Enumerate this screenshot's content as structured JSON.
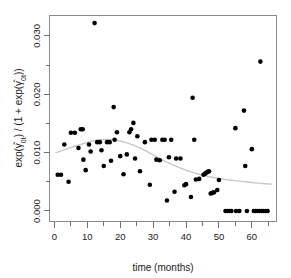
{
  "chart_data": {
    "type": "scatter",
    "title": "",
    "xlabel": "time (months)",
    "ylabel": "exp(γ̂0t) / (1 + exp(γ̂0t))",
    "ylabel_parts": {
      "prefix": "exp(",
      "gamma": "γ",
      "hat": "^",
      "sub1": "0t",
      "mid": ") / (1 + exp(",
      "sub2": "0t",
      "suffix": "))"
    },
    "xlim": [
      -1.5,
      67.5
    ],
    "ylim": [
      -0.0018,
      0.0335
    ],
    "grid": false,
    "legend": "none",
    "xticks": [
      0,
      10,
      20,
      30,
      40,
      50,
      60
    ],
    "xtick_labels": [
      "0",
      "10",
      "20",
      "30",
      "40",
      "50",
      "60"
    ],
    "xminor_ticks": [
      5,
      15,
      25,
      35,
      45,
      55,
      65
    ],
    "yticks": [
      0.0,
      0.01,
      0.02,
      0.03
    ],
    "ytick_labels": [
      "0.000",
      "0.010",
      "0.020",
      "0.030"
    ],
    "yminor_ticks": [
      0.005,
      0.015,
      0.025
    ],
    "point_color": "#000000",
    "point_radius": 2.3,
    "curve_color": "#c8c8c8",
    "frame_color": "#8a8a8a",
    "series": [
      {
        "name": "observed proportions",
        "marker": "filled-circle",
        "points": [
          [
            1.0,
            0.0062
          ],
          [
            2.0,
            0.0062
          ],
          [
            3.0,
            0.0114
          ],
          [
            4.3,
            0.005
          ],
          [
            5.0,
            0.0134
          ],
          [
            6.2,
            0.0134
          ],
          [
            7.3,
            0.0108
          ],
          [
            8.0,
            0.014
          ],
          [
            8.6,
            0.014
          ],
          [
            8.8,
            0.0088
          ],
          [
            9.5,
            0.007
          ],
          [
            10.5,
            0.0114
          ],
          [
            11.0,
            0.0102
          ],
          [
            12.2,
            0.0322
          ],
          [
            13.0,
            0.0118
          ],
          [
            13.8,
            0.0118
          ],
          [
            14.3,
            0.0104
          ],
          [
            15.0,
            0.0077
          ],
          [
            16.0,
            0.0118
          ],
          [
            16.8,
            0.0118
          ],
          [
            17.2,
            0.0086
          ],
          [
            18.0,
            0.0178
          ],
          [
            18.3,
            0.0122
          ],
          [
            19.0,
            0.0135
          ],
          [
            20.0,
            0.0094
          ],
          [
            21.0,
            0.0063
          ],
          [
            22.0,
            0.0097
          ],
          [
            22.8,
            0.0135
          ],
          [
            23.3,
            0.014
          ],
          [
            24.0,
            0.0151
          ],
          [
            24.5,
            0.009
          ],
          [
            25.2,
            0.0128
          ],
          [
            26.0,
            0.0068
          ],
          [
            27.5,
            0.0118
          ],
          [
            29.0,
            0.0045
          ],
          [
            29.5,
            0.0122
          ],
          [
            30.5,
            0.0122
          ],
          [
            31.0,
            0.0088
          ],
          [
            32.0,
            0.0087
          ],
          [
            32.8,
            0.0122
          ],
          [
            33.5,
            0.0122
          ],
          [
            34.2,
            0.0018
          ],
          [
            34.8,
            0.0092
          ],
          [
            35.5,
            0.0122
          ],
          [
            36.5,
            0.0033
          ],
          [
            37.0,
            0.009
          ],
          [
            38.3,
            0.009
          ],
          [
            39.5,
            0.0044
          ],
          [
            40.0,
            0.0046
          ],
          [
            41.5,
            0.0024
          ],
          [
            42.0,
            0.0194
          ],
          [
            42.5,
            0.0122
          ],
          [
            43.0,
            0.0054
          ],
          [
            44.0,
            0.0055
          ],
          [
            45.3,
            0.0062
          ],
          [
            45.8,
            0.0064
          ],
          [
            46.2,
            0.0066
          ],
          [
            46.6,
            0.0067
          ],
          [
            47.0,
            0.0068
          ],
          [
            47.5,
            0.003
          ],
          [
            48.0,
            0.0031
          ],
          [
            48.5,
            0.0032
          ],
          [
            49.5,
            0.0036
          ],
          [
            50.0,
            0.0053
          ],
          [
            52.0,
            0.0
          ],
          [
            52.6,
            0.0
          ],
          [
            53.2,
            0.0
          ],
          [
            53.8,
            0.0
          ],
          [
            55.0,
            0.0142
          ],
          [
            55.2,
            0.0
          ],
          [
            56.2,
            0.0
          ],
          [
            57.6,
            0.0172
          ],
          [
            58.0,
            0.0077
          ],
          [
            58.5,
            0.0
          ],
          [
            60.0,
            0.0106
          ],
          [
            60.6,
            0.0
          ],
          [
            61.2,
            0.0
          ],
          [
            61.8,
            0.0
          ],
          [
            62.4,
            0.0
          ],
          [
            62.6,
            0.0256
          ],
          [
            63.0,
            0.0
          ],
          [
            63.6,
            0.0
          ],
          [
            64.2,
            0.0
          ],
          [
            64.8,
            0.0
          ]
        ]
      }
    ],
    "smooth": {
      "name": "loess smoother",
      "points": [
        [
          0.5,
          0.01
        ],
        [
          2.0,
          0.0103
        ],
        [
          4.0,
          0.0107
        ],
        [
          6.0,
          0.01105
        ],
        [
          8.0,
          0.0114
        ],
        [
          10.0,
          0.01175
        ],
        [
          12.0,
          0.01205
        ],
        [
          14.0,
          0.01222
        ],
        [
          16.0,
          0.01228
        ],
        [
          18.0,
          0.01222
        ],
        [
          20.0,
          0.012
        ],
        [
          22.0,
          0.01168
        ],
        [
          24.0,
          0.01128
        ],
        [
          26.0,
          0.0108
        ],
        [
          28.0,
          0.01022
        ],
        [
          30.0,
          0.0096
        ],
        [
          32.0,
          0.009
        ],
        [
          34.0,
          0.00842
        ],
        [
          36.0,
          0.0079
        ],
        [
          38.0,
          0.00742
        ],
        [
          40.0,
          0.007
        ],
        [
          42.0,
          0.00662
        ],
        [
          44.0,
          0.0063
        ],
        [
          46.0,
          0.00602
        ],
        [
          48.0,
          0.00578
        ],
        [
          50.0,
          0.00558
        ],
        [
          52.0,
          0.0054
        ],
        [
          54.0,
          0.00525
        ],
        [
          56.0,
          0.00512
        ],
        [
          58.0,
          0.005
        ],
        [
          60.0,
          0.00488
        ],
        [
          62.0,
          0.00478
        ],
        [
          64.0,
          0.00468
        ],
        [
          66.0,
          0.0046
        ]
      ]
    }
  }
}
